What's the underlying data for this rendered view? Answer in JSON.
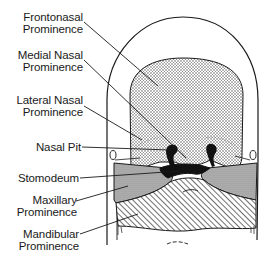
{
  "diagram": {
    "labels": [
      {
        "id": "frontonasal",
        "line1": "Frontonasal",
        "line2": "Prominence"
      },
      {
        "id": "medial-nasal",
        "line1": "Medial Nasal",
        "line2": "Prominence"
      },
      {
        "id": "lateral-nasal",
        "line1": "Lateral Nasal",
        "line2": "Prominence"
      },
      {
        "id": "nasal-pit",
        "line1": "Nasal Pit",
        "line2": ""
      },
      {
        "id": "stomodeum",
        "line1": "Stomodeum",
        "line2": ""
      },
      {
        "id": "maxillary",
        "line1": "Maxillary",
        "line2": "Prominence"
      },
      {
        "id": "mandibular",
        "line1": "Mandibular",
        "line2": "Prominence"
      }
    ],
    "colors": {
      "outline": "#1a1a1a",
      "stipple": "#555555",
      "maxillary_fill": "#a8a8a8",
      "stomodeum_fill": "#111111",
      "background": "#ffffff"
    }
  }
}
